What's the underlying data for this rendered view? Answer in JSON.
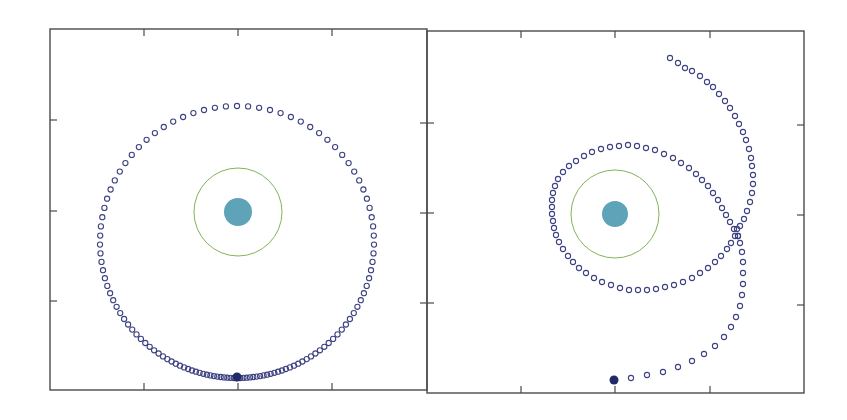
{
  "figure": {
    "colors": {
      "frame": "#4a4a4a",
      "planet": "#5fa3b8",
      "ring": "#7fb35a",
      "marker": "#3d4280",
      "start_marker": "#1f2a6b",
      "background": "#ffffff"
    },
    "panels": [
      {
        "id": "left",
        "frame": {
          "x": 50,
          "y": 29,
          "w": 377,
          "h": 361
        },
        "x_ticks": [
          144,
          238,
          332
        ],
        "y_ticks": [
          120,
          211,
          301
        ],
        "y_ticks_right": [
          123,
          213,
          303
        ],
        "planet": {
          "cx": 238,
          "cy": 212,
          "r": 14
        },
        "ring": {
          "cx": 238,
          "cy": 212,
          "r": 44
        },
        "start_point": {
          "x": 237,
          "y": 377
        },
        "trajectory_type": "bound-orbit"
      },
      {
        "id": "right",
        "frame": {
          "x": 427,
          "y": 31,
          "w": 377,
          "h": 362
        },
        "x_ticks": [
          521,
          615,
          710
        ],
        "y_ticks": [
          123,
          213,
          303
        ],
        "y_ticks_right": [
          125,
          215,
          305
        ],
        "planet": {
          "cx": 615,
          "cy": 214,
          "r": 13
        },
        "ring": {
          "cx": 615,
          "cy": 214,
          "r": 44
        },
        "start_point": {
          "x": 614,
          "y": 380
        },
        "trajectory_type": "escape-orbit"
      }
    ]
  },
  "chart_data": [
    {
      "type": "scatter",
      "title": "",
      "xlabel": "",
      "ylabel": "",
      "description": "Left panel: spacecraft trajectory (open circles) around a central body (filled teal disk) with a green circular reference orbit; closed elliptical orbit starting at the bottom (filled dark marker).",
      "grid": false,
      "legend": null,
      "series": [
        {
          "name": "trajectory",
          "marker": "open-circle",
          "orbit": {
            "cx": 237,
            "cy": 242,
            "rx": 137,
            "ry": 136,
            "start_angle_deg": 90,
            "sweep_deg": 360,
            "count": 120,
            "density_bias": 2.2
          }
        },
        {
          "name": "start",
          "marker": "filled-circle",
          "points": [
            [
              237,
              377
            ]
          ]
        },
        {
          "name": "central-body",
          "marker": "filled-disk",
          "points": [
            [
              238,
              212
            ]
          ]
        },
        {
          "name": "reference-orbit",
          "marker": "line-circle",
          "radius": 44
        }
      ]
    },
    {
      "type": "scatter",
      "title": "",
      "xlabel": "",
      "ylabel": "",
      "description": "Right panel: trajectory starts at bottom (filled marker), sweeps up the right side, loops once around the central body, then escapes toward the upper right.",
      "grid": false,
      "legend": null,
      "series": [
        {
          "name": "trajectory-outbound",
          "marker": "open-circle",
          "points": [
            [
              614,
              380
            ],
            [
              631,
              378
            ],
            [
              647,
              375
            ],
            [
              663,
              372
            ],
            [
              678,
              367
            ],
            [
              692,
              361
            ],
            [
              704,
              354
            ],
            [
              715,
              346
            ],
            [
              724,
              337
            ],
            [
              731,
              327
            ],
            [
              736,
              317
            ],
            [
              740,
              306
            ],
            [
              742,
              295
            ],
            [
              743,
              284
            ],
            [
              743,
              273
            ],
            [
              743,
              262
            ],
            [
              742,
              252
            ],
            [
              740,
              243
            ],
            [
              738,
              236
            ]
          ]
        },
        {
          "name": "trajectory-loop",
          "marker": "open-circle",
          "points": [
            [
              738,
              236
            ],
            [
              734,
              229
            ],
            [
              730,
              222
            ],
            [
              726,
              215
            ],
            [
              722,
              208
            ],
            [
              718,
              200
            ],
            [
              713,
              193
            ],
            [
              708,
              186
            ],
            [
              702,
              180
            ],
            [
              696,
              174
            ],
            [
              689,
              168
            ],
            [
              681,
              163
            ],
            [
              673,
              158
            ],
            [
              664,
              154
            ],
            [
              655,
              150
            ],
            [
              646,
              148
            ],
            [
              637,
              146
            ],
            [
              628,
              145
            ],
            [
              619,
              146
            ],
            [
              610,
              147
            ],
            [
              601,
              149
            ],
            [
              592,
              152
            ],
            [
              584,
              156
            ],
            [
              576,
              161
            ],
            [
              569,
              166
            ],
            [
              563,
              172
            ],
            [
              558,
              179
            ],
            [
              555,
              186
            ],
            [
              553,
              193
            ],
            [
              552,
              200
            ],
            [
              552,
              207
            ],
            [
              552,
              214
            ],
            [
              553,
              221
            ],
            [
              554,
              228
            ],
            [
              556,
              235
            ],
            [
              559,
              242
            ],
            [
              563,
              249
            ],
            [
              568,
              256
            ],
            [
              573,
              262
            ],
            [
              579,
              268
            ],
            [
              586,
              273
            ],
            [
              594,
              278
            ],
            [
              602,
              282
            ],
            [
              611,
              285
            ],
            [
              620,
              288
            ],
            [
              629,
              290
            ],
            [
              638,
              290
            ],
            [
              647,
              290
            ],
            [
              656,
              289
            ],
            [
              665,
              287
            ],
            [
              674,
              285
            ],
            [
              683,
              282
            ],
            [
              692,
              278
            ],
            [
              700,
              273
            ],
            [
              708,
              268
            ],
            [
              715,
              262
            ],
            [
              721,
              256
            ],
            [
              727,
              249
            ],
            [
              731,
              243
            ],
            [
              735,
              236
            ],
            [
              737,
              229
            ]
          ]
        },
        {
          "name": "trajectory-escape",
          "marker": "open-circle",
          "points": [
            [
              740,
              226
            ],
            [
              744,
              219
            ],
            [
              747,
              211
            ],
            [
              750,
              202
            ],
            [
              752,
              193
            ],
            [
              753,
              184
            ],
            [
              753,
              175
            ],
            [
              752,
              166
            ],
            [
              751,
              158
            ],
            [
              749,
              149
            ],
            [
              746,
              140
            ],
            [
              743,
              132
            ],
            [
              739,
              124
            ],
            [
              735,
              116
            ],
            [
              730,
              108
            ],
            [
              725,
              101
            ],
            [
              719,
              94
            ],
            [
              713,
              87
            ],
            [
              707,
              82
            ],
            [
              700,
              76
            ],
            [
              692,
              71
            ],
            [
              685,
              68
            ],
            [
              678,
              63
            ],
            [
              670,
              58
            ]
          ]
        },
        {
          "name": "start",
          "marker": "filled-circle",
          "points": [
            [
              614,
              380
            ]
          ]
        },
        {
          "name": "central-body",
          "marker": "filled-disk",
          "points": [
            [
              615,
              214
            ]
          ]
        },
        {
          "name": "reference-orbit",
          "marker": "line-circle",
          "radius": 44
        }
      ]
    }
  ]
}
